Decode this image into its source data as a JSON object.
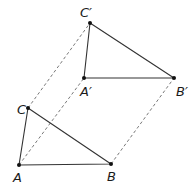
{
  "diagram": {
    "type": "translation",
    "colors": {
      "solid": "#333333",
      "dashed": "#555555",
      "point": "#111111",
      "background": "#ffffff"
    },
    "points": {
      "A": {
        "label": "A",
        "x": 19,
        "y": 165,
        "lx": 13,
        "ly": 182
      },
      "B": {
        "label": "B",
        "x": 111,
        "y": 164,
        "lx": 107,
        "ly": 181
      },
      "C": {
        "label": "C",
        "x": 28,
        "y": 108,
        "lx": 17,
        "ly": 114
      },
      "A2": {
        "label": "A′",
        "x": 84,
        "y": 78,
        "lx": 80,
        "ly": 96
      },
      "B2": {
        "label": "B′",
        "x": 174,
        "y": 78,
        "lx": 176,
        "ly": 96
      },
      "C2": {
        "label": "C′",
        "x": 90,
        "y": 23,
        "lx": 80,
        "ly": 17
      }
    },
    "triangles": [
      {
        "name": "original",
        "vertices": [
          "A",
          "B",
          "C"
        ]
      },
      {
        "name": "image",
        "vertices": [
          "A2",
          "B2",
          "C2"
        ]
      }
    ],
    "dashed_segments": [
      [
        "A",
        "A2"
      ],
      [
        "B",
        "B2"
      ],
      [
        "C",
        "C2"
      ]
    ]
  }
}
